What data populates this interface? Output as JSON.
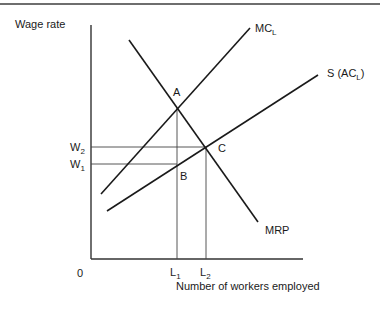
{
  "diagram": {
    "y_axis_label": "Wage rate",
    "x_axis_label": "Number of workers employed",
    "origin_label": "0",
    "curves": {
      "mcl": {
        "label": "MC",
        "sub": "L"
      },
      "supply": {
        "label_prefix": "S (AC",
        "sub": "L",
        "label_suffix": ")"
      },
      "mrp": {
        "label": "MRP"
      }
    },
    "points": {
      "a": "A",
      "b": "B",
      "c": "C"
    },
    "y_ticks": {
      "w2": {
        "label": "W",
        "sub": "2"
      },
      "w1": {
        "label": "W",
        "sub": "1"
      }
    },
    "x_ticks": {
      "l1": {
        "label": "L",
        "sub": "1"
      },
      "l2": {
        "label": "L",
        "sub": "2"
      }
    }
  }
}
